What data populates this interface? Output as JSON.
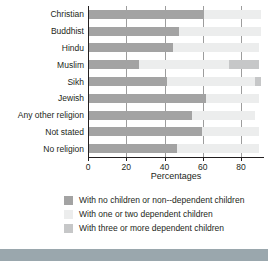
{
  "chart_data": {
    "type": "bar",
    "orientation": "horizontal",
    "stacked": true,
    "title": "",
    "xlabel": "Percentages",
    "ylabel": "",
    "xlim": [
      0,
      92
    ],
    "xticks": [
      0,
      20,
      40,
      60,
      80
    ],
    "xtick_labels": [
      "0",
      "20",
      "40",
      "60",
      "80"
    ],
    "grid": true,
    "legend_position": "bottom",
    "categories": [
      "Christian",
      "Buddhist",
      "Hindu",
      "Muslim",
      "Sikh",
      "Jewish",
      "Any other religion",
      "Not stated",
      "No religion"
    ],
    "series": [
      {
        "name": "With no children or non--dependent children",
        "color": "#a3a3a3",
        "values": [
          60,
          47,
          44,
          26,
          41,
          61,
          54,
          59,
          46
        ]
      },
      {
        "name": "With one or two dependent children",
        "color": "#eceded",
        "values": [
          30,
          43,
          45,
          47,
          46,
          28,
          33,
          30,
          43
        ]
      },
      {
        "name": "With three or more dependent children",
        "color": "#c6c7c8",
        "values": [
          0,
          0,
          0,
          16,
          3,
          0,
          0,
          0,
          0
        ]
      }
    ]
  },
  "legend": {
    "items": [
      {
        "label": "With no children or non--dependent children",
        "swatch": "swatch-dark-gray"
      },
      {
        "label": "With one or two dependent children",
        "swatch": "swatch-light-gray"
      },
      {
        "label": "With three or more dependent children",
        "swatch": "swatch-mid-gray"
      }
    ]
  },
  "axis": {
    "x_title": "Percentages"
  }
}
